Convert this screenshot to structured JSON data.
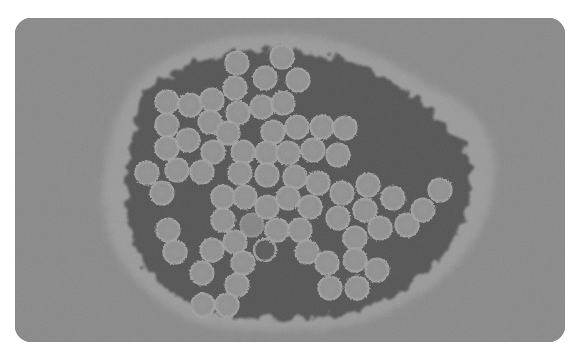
{
  "image": {
    "alt": "Electron micrograph of a cluster of spherical virus particles",
    "colors": {
      "background": "#8b8b8b",
      "halo": "#b9b9b9",
      "core": "#0e0e0e",
      "particle": "#9c9c9c",
      "particle_edge": "#c8c8c8"
    },
    "particle_radius": 12,
    "particles": [
      [
        237,
        63
      ],
      [
        282,
        57
      ],
      [
        265,
        78
      ],
      [
        298,
        80
      ],
      [
        235,
        88
      ],
      [
        167,
        102
      ],
      [
        190,
        105
      ],
      [
        212,
        100
      ],
      [
        238,
        113
      ],
      [
        262,
        107
      ],
      [
        283,
        103
      ],
      [
        167,
        125
      ],
      [
        210,
        122
      ],
      [
        228,
        133
      ],
      [
        273,
        132
      ],
      [
        297,
        127
      ],
      [
        322,
        127
      ],
      [
        345,
        128
      ],
      [
        167,
        148
      ],
      [
        188,
        140
      ],
      [
        213,
        152
      ],
      [
        243,
        152
      ],
      [
        267,
        153
      ],
      [
        288,
        153
      ],
      [
        313,
        150
      ],
      [
        338,
        155
      ],
      [
        147,
        173
      ],
      [
        177,
        170
      ],
      [
        202,
        172
      ],
      [
        240,
        173
      ],
      [
        267,
        175
      ],
      [
        295,
        177
      ],
      [
        318,
        183
      ],
      [
        162,
        193
      ],
      [
        223,
        197
      ],
      [
        245,
        197
      ],
      [
        267,
        207
      ],
      [
        288,
        198
      ],
      [
        310,
        207
      ],
      [
        342,
        193
      ],
      [
        368,
        185
      ],
      [
        393,
        198
      ],
      [
        440,
        190
      ],
      [
        223,
        220
      ],
      [
        252,
        225
      ],
      [
        277,
        230
      ],
      [
        300,
        230
      ],
      [
        338,
        218
      ],
      [
        365,
        210
      ],
      [
        380,
        228
      ],
      [
        407,
        225
      ],
      [
        423,
        210
      ],
      [
        168,
        230
      ],
      [
        175,
        252
      ],
      [
        212,
        250
      ],
      [
        235,
        242
      ],
      [
        307,
        252
      ],
      [
        355,
        238
      ],
      [
        202,
        273
      ],
      [
        243,
        263
      ],
      [
        327,
        263
      ],
      [
        355,
        260
      ],
      [
        377,
        270
      ],
      [
        237,
        285
      ],
      [
        203,
        305
      ],
      [
        227,
        305
      ],
      [
        330,
        288
      ],
      [
        357,
        288
      ]
    ],
    "hollow_particles": [
      [
        265,
        250
      ]
    ],
    "faint_particles": [
      [
        252,
        225
      ]
    ]
  }
}
